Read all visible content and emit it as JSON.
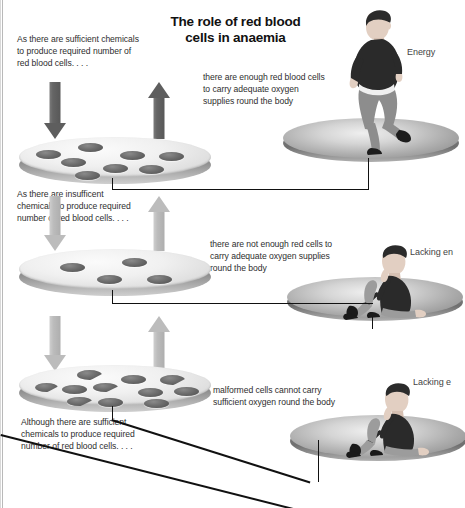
{
  "document": {
    "title": "The role of red blood cells in anaemia",
    "title_line_1": "The role of red blood",
    "title_line_2": "cells in anaemia"
  },
  "panels": [
    {
      "id": "normal",
      "left_note": "As there are sufficient chemicals to produce required number of red blood cells. . . .",
      "center_note": "there are enough red blood cells to carry adequate oxygen supplies round the body",
      "right_label": "Energy",
      "cell_count": 8,
      "malformed_count": 0,
      "figure": "running-man"
    },
    {
      "id": "anaemia-deficiency",
      "left_note": "As there are insufficent chemicals to produce required number of red blood cells. . . .",
      "center_note": "there are not enough red cells to carry adequate oxygen supplies round the body",
      "right_label": "Lacking en",
      "cell_count": 4,
      "malformed_count": 0,
      "figure": "seated-man"
    },
    {
      "id": "anaemia-malformed",
      "left_note": "Although there are sufficient chemicals to produce required number of red blood cells. . . .",
      "center_note": "malformed cells cannot carry sufficient oxygen round the body",
      "right_label": "Lacking e",
      "cell_count": 11,
      "malformed_count": 4,
      "figure": "seated-man"
    }
  ],
  "colors": {
    "ink": "#111111",
    "body_text": "#2e2e2e",
    "arrow_dark": "#5e5e5e",
    "arrow_mid": "#838383",
    "arrow_pale": "#bcbcbc",
    "cell_fill": "#5b5b5b",
    "platter_top": "#f0f0f0",
    "stage_top": "#adadad",
    "background": "#ffffff"
  }
}
